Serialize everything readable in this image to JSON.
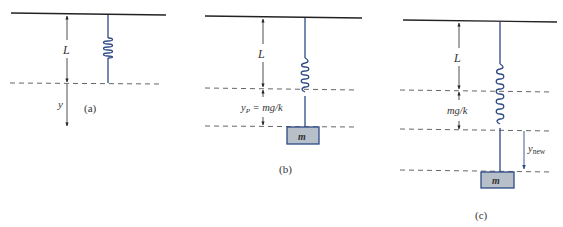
{
  "figure": {
    "colors": {
      "line": "#222222",
      "spring": "#2d4a86",
      "mass_fill": "#b7bfc9",
      "mass_stroke": "#2d4a86",
      "dash": "#555555",
      "text": "#333333"
    },
    "panels": [
      {
        "id": "a",
        "caption": "(a)",
        "length_label": "L",
        "displacement_label": "y"
      },
      {
        "id": "b",
        "caption": "(b)",
        "length_label": "L",
        "stretch_label_main": "y",
        "stretch_label_sub": "P",
        "stretch_label_rest": " = mg/k",
        "mass_label": "m"
      },
      {
        "id": "c",
        "caption": "(c)",
        "length_label": "L",
        "stretch_label": "mg/k",
        "displacement_label_main": "y",
        "displacement_label_sub": "new",
        "mass_label": "m"
      }
    ]
  }
}
